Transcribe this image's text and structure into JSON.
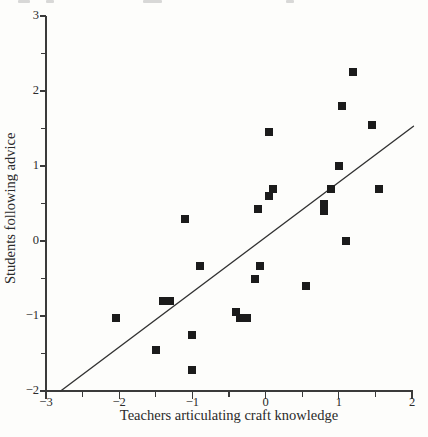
{
  "chart_data": {
    "type": "scatter",
    "title": "",
    "xlabel": "Teachers articulating craft knowledge",
    "ylabel": "Students following advice",
    "xlim": [
      -3,
      2
    ],
    "ylim": [
      -2,
      3
    ],
    "x_major_ticks": [
      -3,
      -2,
      -1,
      0,
      1,
      2
    ],
    "y_major_ticks": [
      -2,
      -1,
      0,
      1,
      2,
      3
    ],
    "minor_tick_step": 0.5,
    "grid": false,
    "legend": "none",
    "marker": "filled-square",
    "marker_color": "#1b1b1b",
    "points": [
      [
        1.2,
        2.25
      ],
      [
        1.05,
        1.8
      ],
      [
        1.45,
        1.55
      ],
      [
        0.05,
        1.45
      ],
      [
        1.0,
        1.0
      ],
      [
        0.1,
        0.7
      ],
      [
        0.05,
        0.6
      ],
      [
        0.9,
        0.7
      ],
      [
        1.55,
        0.7
      ],
      [
        -0.1,
        0.43
      ],
      [
        0.8,
        0.5
      ],
      [
        0.8,
        0.4
      ],
      [
        1.1,
        0.0
      ],
      [
        -1.1,
        0.3
      ],
      [
        -0.9,
        -0.33
      ],
      [
        -0.08,
        -0.33
      ],
      [
        -0.15,
        -0.5
      ],
      [
        0.55,
        -0.6
      ],
      [
        -0.4,
        -0.95
      ],
      [
        -0.35,
        -1.03
      ],
      [
        -0.25,
        -1.03
      ],
      [
        -2.05,
        -1.03
      ],
      [
        -1.4,
        -0.8
      ],
      [
        -1.3,
        -0.8
      ],
      [
        -1.5,
        -1.45
      ],
      [
        -1.0,
        -1.25
      ],
      [
        -1.0,
        -1.72
      ]
    ],
    "trend_line": {
      "x1": -2.8,
      "y1": -2.0,
      "x2": 2.02,
      "y2": 1.53,
      "color": "#333333",
      "width": 1.4
    }
  }
}
